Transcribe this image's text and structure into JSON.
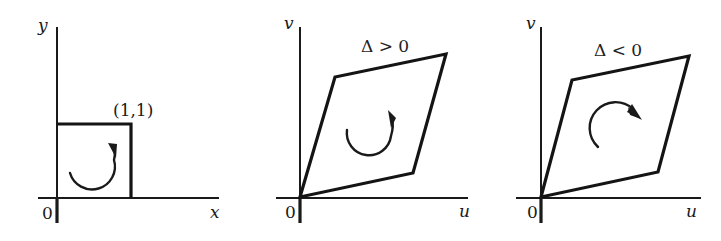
{
  "figure": {
    "panels": [
      {
        "id": "square-domain",
        "axes": {
          "horizontal_label": "x",
          "vertical_label": "y",
          "origin_label": "0"
        },
        "shape": "unit square",
        "corner_label": "(1,1)",
        "orientation_arrow": "counterclockwise",
        "condition_label": ""
      },
      {
        "id": "image-positive-jacobian",
        "axes": {
          "horizontal_label": "u",
          "vertical_label": "v",
          "origin_label": "0"
        },
        "shape": "parallelogram",
        "corner_label": "",
        "orientation_arrow": "counterclockwise",
        "condition_label": "Δ > 0"
      },
      {
        "id": "image-negative-jacobian",
        "axes": {
          "horizontal_label": "u",
          "vertical_label": "v",
          "origin_label": "0"
        },
        "shape": "parallelogram",
        "corner_label": "",
        "orientation_arrow": "clockwise",
        "condition_label": "Δ < 0"
      }
    ]
  },
  "colors": {
    "ink": "#1a1a1a",
    "background": "#ffffff"
  }
}
